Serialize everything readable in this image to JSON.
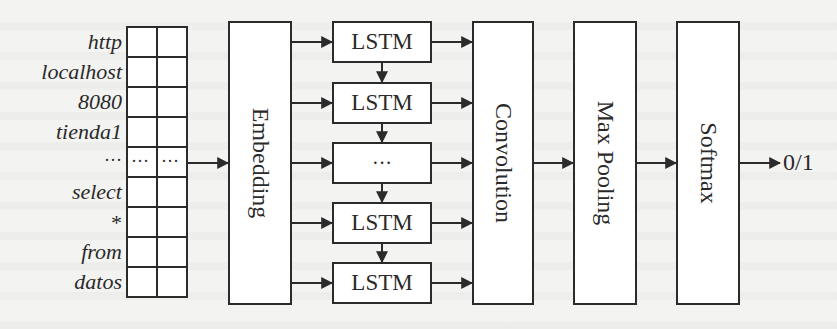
{
  "diagram": {
    "title": "",
    "input_tokens": [
      "http",
      "localhost",
      "8080",
      "tienda1",
      "···",
      "select",
      "*",
      "from",
      "datos"
    ],
    "grid": {
      "rows": 9,
      "columns": 2,
      "ellipsis_row_index": 4,
      "cell_ellipsis": "···"
    },
    "layers": {
      "embedding": "Embedding",
      "lstm_cells": [
        "LSTM",
        "LSTM",
        "···",
        "LSTM",
        "LSTM"
      ],
      "convolution": "Convolution",
      "max_pooling": "Max Pooling",
      "softmax": "Softmax"
    },
    "output": "0/1",
    "colors": {
      "stroke": "#2b2b2b",
      "box_fill": "#ffffff",
      "background": "#f3f3f1"
    }
  }
}
